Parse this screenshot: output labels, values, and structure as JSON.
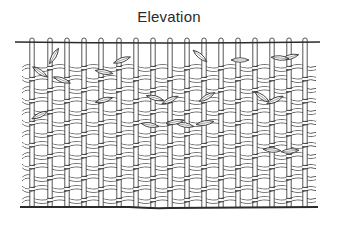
{
  "diagram": {
    "title": "Elevation",
    "colors": {
      "ink": "#2b2b2b",
      "background": "#ffffff"
    },
    "warp_columns_x": [
      32,
      50,
      67,
      84,
      101,
      119,
      136,
      153,
      170,
      187,
      204,
      221,
      238,
      255,
      272,
      289,
      305
    ],
    "weft_rows_y": [
      68,
      79,
      90,
      101,
      112,
      123,
      134,
      145,
      156,
      167,
      178,
      189,
      200
    ],
    "top_rail": {
      "x1": 15,
      "x2": 320,
      "y": 43
    },
    "baseline": {
      "x1": 20,
      "x2": 318,
      "y": 207
    },
    "weft_extent": {
      "x1": 22,
      "x2": 316
    },
    "leaves": [
      {
        "x": 40,
        "y": 72,
        "angle": 35
      },
      {
        "x": 54,
        "y": 56,
        "angle": -60
      },
      {
        "x": 62,
        "y": 80,
        "angle": 20
      },
      {
        "x": 40,
        "y": 115,
        "angle": -25
      },
      {
        "x": 122,
        "y": 60,
        "angle": -20
      },
      {
        "x": 104,
        "y": 72,
        "angle": 10
      },
      {
        "x": 104,
        "y": 100,
        "angle": -15
      },
      {
        "x": 155,
        "y": 98,
        "angle": 15
      },
      {
        "x": 170,
        "y": 100,
        "angle": -25
      },
      {
        "x": 200,
        "y": 56,
        "angle": 40
      },
      {
        "x": 207,
        "y": 97,
        "angle": -30
      },
      {
        "x": 240,
        "y": 60,
        "angle": 0
      },
      {
        "x": 185,
        "y": 125,
        "angle": 10
      },
      {
        "x": 205,
        "y": 123,
        "angle": -10
      },
      {
        "x": 262,
        "y": 97,
        "angle": 35
      },
      {
        "x": 275,
        "y": 100,
        "angle": -25
      },
      {
        "x": 290,
        "y": 57,
        "angle": -15
      },
      {
        "x": 280,
        "y": 58,
        "angle": 5
      },
      {
        "x": 272,
        "y": 150,
        "angle": 5
      },
      {
        "x": 290,
        "y": 151,
        "angle": -5
      },
      {
        "x": 150,
        "y": 125,
        "angle": 10
      },
      {
        "x": 175,
        "y": 122,
        "angle": -10
      }
    ]
  }
}
